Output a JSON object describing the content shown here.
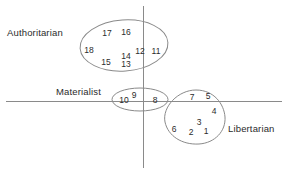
{
  "figure": {
    "type": "cluster-scatter-diagram",
    "width": 287,
    "height": 174,
    "background": "#ffffff",
    "stroke_color": "#8a8a8a",
    "text_color": "#2b2b2b"
  },
  "axes": {
    "horizontal": {
      "y": 101.5,
      "x_start": 6,
      "x_end": 282
    },
    "vertical": {
      "x": 143.5,
      "y_start": 6,
      "y_end": 168
    }
  },
  "clusters": [
    {
      "id": "authoritarian",
      "label": "Authoritarian",
      "label_x": 7,
      "label_y": 27,
      "shape": "ellipse",
      "cx": 124,
      "cy": 45.5,
      "rx": 44,
      "ry": 25.5,
      "rotation": -4,
      "members": [
        {
          "value": "17",
          "x": 107,
          "y": 33
        },
        {
          "value": "16",
          "x": 126,
          "y": 32
        },
        {
          "value": "18",
          "x": 89,
          "y": 50
        },
        {
          "value": "14",
          "x": 126,
          "y": 56
        },
        {
          "value": "12",
          "x": 140,
          "y": 51
        },
        {
          "value": "11",
          "x": 156,
          "y": 51
        },
        {
          "value": "15",
          "x": 106,
          "y": 62
        },
        {
          "value": "13",
          "x": 126,
          "y": 64
        }
      ]
    },
    {
      "id": "materialist",
      "label": "Materialist",
      "label_x": 56,
      "label_y": 86,
      "shape": "ellipse",
      "cx": 140,
      "cy": 99.5,
      "rx": 28,
      "ry": 11.5,
      "rotation": 0,
      "members": [
        {
          "value": "10",
          "x": 124,
          "y": 100
        },
        {
          "value": "9",
          "x": 134,
          "y": 95
        },
        {
          "value": "8",
          "x": 155,
          "y": 100
        }
      ]
    },
    {
      "id": "libertarian",
      "label": "Libertarian",
      "label_x": 228,
      "label_y": 123,
      "shape": "blob",
      "path": "M 196 90 C 214 90 224 104 225 117 C 226 131 215 143 199 144 C 182 145 168 136 165 122 C 162 107 178 90 196 90 Z",
      "members": [
        {
          "value": "7",
          "x": 192,
          "y": 97
        },
        {
          "value": "5",
          "x": 208,
          "y": 96
        },
        {
          "value": "4",
          "x": 214,
          "y": 111
        },
        {
          "value": "3",
          "x": 199,
          "y": 122
        },
        {
          "value": "6",
          "x": 174,
          "y": 129
        },
        {
          "value": "2",
          "x": 191,
          "y": 132
        },
        {
          "value": "1",
          "x": 206,
          "y": 131
        }
      ]
    }
  ]
}
